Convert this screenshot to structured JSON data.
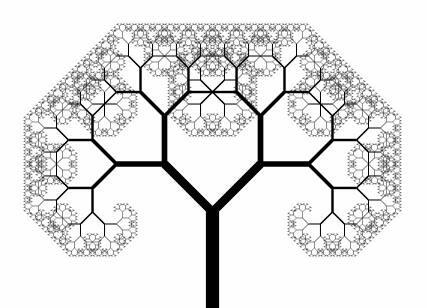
{
  "figure": {
    "type": "fractal-tree-diagram",
    "background_color": "#fefefe",
    "stroke_color": "#000000",
    "canvas_width": 427,
    "canvas_height": 308
  },
  "chart_data": {
    "type": "diagram",
    "subtitle": "",
    "xlabel": "",
    "ylabel": "",
    "grid": false,
    "legend": "none",
    "tree_parameters": {
      "trunk_base_x": 212.5,
      "trunk_base_y": 308,
      "fork_x": 212.5,
      "fork_y": 212,
      "trunk_length": 96,
      "trunk_width": 13.2,
      "branch_angle_degrees": 45,
      "length_ratio": 0.707,
      "width_ratio": 0.655,
      "min_width": 0.45,
      "depth": 13,
      "initial_heading_degrees": 90,
      "symmetry": "bilateral-mirror"
    },
    "level_lengths": [
      96,
      67.9,
      48,
      33.9,
      24,
      17,
      12,
      8.5,
      6,
      4.2,
      3,
      2.1,
      1.5,
      1.05
    ],
    "level_widths": [
      13.2,
      8.65,
      5.66,
      3.71,
      2.43,
      1.59,
      1.04,
      0.68,
      0.45,
      0.45,
      0.45,
      0.45,
      0.45,
      0.45
    ],
    "key_nodes": [
      {
        "name": "trunk-base",
        "x": 212.5,
        "y": 308
      },
      {
        "name": "fork",
        "x": 212.5,
        "y": 212
      },
      {
        "name": "left-primary",
        "x": 164.5,
        "y": 164
      },
      {
        "name": "right-primary",
        "x": 260.5,
        "y": 164
      },
      {
        "name": "left-secondary",
        "x": 96.5,
        "y": 152
      },
      {
        "name": "right-secondary",
        "x": 328.5,
        "y": 152
      }
    ],
    "bounds": {
      "left": 12,
      "right": 415,
      "top": 13,
      "bottom": 308
    }
  }
}
